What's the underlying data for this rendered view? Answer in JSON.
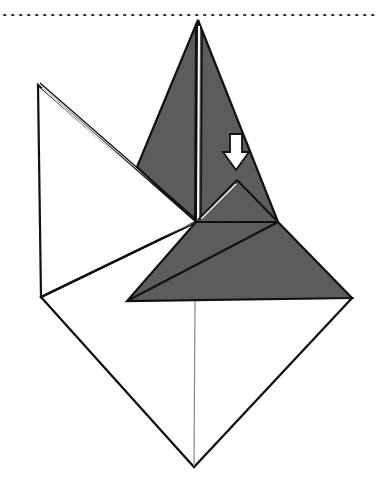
{
  "diagram": {
    "type": "origami-fold-step",
    "description": "Origami folding step: a kite/diamond base with a grey (colored side) pointed flap on top and a grey triangular flap across the middle; a white arrow indicates folding the small point down along the dash-dot line.",
    "colors": {
      "paper_white": "#ffffff",
      "paper_colored": "#5c5c5c",
      "line": "#111111",
      "guide_line": "#888888",
      "background": "#ffffff"
    },
    "elements": {
      "top_edge_line": "dotted",
      "fold_line": "dash-dot (valley fold)",
      "arrow": "white down arrow (fold in direction)"
    },
    "labels": []
  }
}
